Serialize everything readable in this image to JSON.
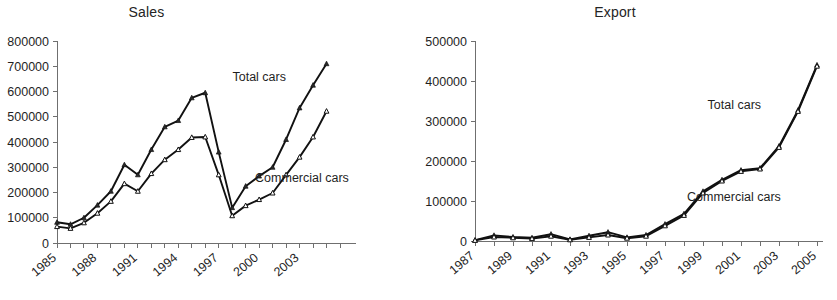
{
  "chart_data": [
    {
      "id": "sales",
      "type": "line",
      "title": "Sales",
      "xlabel": "",
      "ylabel": "",
      "ylim": [
        0,
        800000
      ],
      "ytick_labels": [
        "0",
        "100000",
        "200000",
        "300000",
        "400000",
        "500000",
        "600000",
        "700000",
        "800000"
      ],
      "yticks": [
        0,
        100000,
        200000,
        300000,
        400000,
        500000,
        600000,
        700000,
        800000
      ],
      "grid": false,
      "legend_position": "inline-annotation",
      "x": [
        1985,
        1986,
        1987,
        1988,
        1989,
        1990,
        1991,
        1992,
        1993,
        1994,
        1995,
        1996,
        1997,
        1998,
        1999,
        2000,
        2001,
        2002,
        2003,
        2004,
        2005
      ],
      "xtick_labels": [
        "1985",
        "1988",
        "1991",
        "1994",
        "1997",
        "2000",
        "2003"
      ],
      "xtick_label_years": [
        1985,
        1988,
        1991,
        1994,
        1997,
        2000,
        2003
      ],
      "series": [
        {
          "name": "Total cars",
          "values": [
            82000,
            74000,
            100000,
            150000,
            205000,
            310000,
            270000,
            370000,
            460000,
            485000,
            575000,
            595000,
            360000,
            140000,
            225000,
            265000,
            300000,
            410000,
            535000,
            625000,
            710000
          ]
        },
        {
          "name": "Commercial cars",
          "values": [
            65000,
            58000,
            80000,
            118000,
            165000,
            235000,
            205000,
            275000,
            330000,
            370000,
            418000,
            420000,
            270000,
            108000,
            148000,
            172000,
            198000,
            270000,
            340000,
            420000,
            522000
          ]
        }
      ],
      "annotations": [
        {
          "text": "Total cars",
          "x_frac": 0.62,
          "y_frac": 0.8
        },
        {
          "text": "Commercial cars",
          "x_frac": 0.7,
          "y_frac": 0.3
        }
      ]
    },
    {
      "id": "export",
      "type": "line",
      "title": "Export",
      "xlabel": "",
      "ylabel": "",
      "ylim": [
        0,
        500000
      ],
      "ytick_labels": [
        "0",
        "100000",
        "200000",
        "300000",
        "400000",
        "500000"
      ],
      "yticks": [
        0,
        100000,
        200000,
        300000,
        400000,
        500000
      ],
      "grid": false,
      "legend_position": "inline-annotation",
      "x": [
        1987,
        1988,
        1989,
        1990,
        1991,
        1992,
        1993,
        1994,
        1995,
        1996,
        1997,
        1998,
        1999,
        2000,
        2001,
        2002,
        2003,
        2004,
        2005
      ],
      "xtick_labels": [
        "1987",
        "1989",
        "1991",
        "1993",
        "1995",
        "1997",
        "1999",
        "2001",
        "2003",
        "2005"
      ],
      "xtick_label_years": [
        1987,
        1989,
        1991,
        1993,
        1995,
        1997,
        1999,
        2001,
        2003,
        2005
      ],
      "series": [
        {
          "name": "Total cars",
          "values": [
            2000,
            14000,
            10000,
            8000,
            17000,
            4000,
            13000,
            22000,
            9000,
            15000,
            42000,
            68000,
            124000,
            153000,
            177000,
            182000,
            237000,
            327000,
            440000
          ]
        },
        {
          "name": "Commercial cars",
          "values": [
            1500,
            10000,
            8000,
            6000,
            12000,
            3000,
            9000,
            15000,
            7000,
            12000,
            38000,
            64000,
            120000,
            150000,
            174000,
            180000,
            234000,
            324000,
            437000
          ]
        }
      ],
      "annotations": [
        {
          "text": "Total cars",
          "x_frac": 0.68,
          "y_frac": 0.66
        },
        {
          "text": "Commercial cars",
          "x_frac": 0.62,
          "y_frac": 0.2
        }
      ]
    }
  ],
  "panels": {
    "sales": {
      "title": "Sales",
      "series_total_label": "Total cars",
      "series_commercial_label": "Commercial cars"
    },
    "export": {
      "title": "Export",
      "series_total_label": "Total cars",
      "series_commercial_label": "Commercial cars"
    }
  },
  "colors": {
    "line": "#111111",
    "axis": "#6f6f6f",
    "text": "#1f1f1f",
    "background": "#ffffff"
  }
}
